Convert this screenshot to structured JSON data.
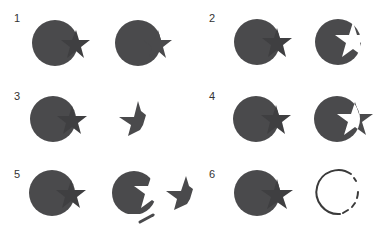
{
  "colors": {
    "shape_fill": "#4a4a4c",
    "overlap_fill": "#3e3e40",
    "background": "#ffffff",
    "outline": "#3a3a3a"
  },
  "panels": [
    {
      "number": "1",
      "operation": "unite",
      "before": "circle + star",
      "after": "merged circle-star silhouette"
    },
    {
      "number": "2",
      "operation": "minus front",
      "before": "circle + star",
      "after": "circle with star-shaped cutout"
    },
    {
      "number": "3",
      "operation": "intersect",
      "before": "circle + star",
      "after": "star fragment inside circle"
    },
    {
      "number": "4",
      "operation": "exclude",
      "before": "circle + star",
      "after": "circle and star with overlap removed"
    },
    {
      "number": "5",
      "operation": "divide",
      "before": "circle + star",
      "after": "separated pieces"
    },
    {
      "number": "6",
      "operation": "outline",
      "before": "circle + star",
      "after": "circle outline segments"
    }
  ]
}
